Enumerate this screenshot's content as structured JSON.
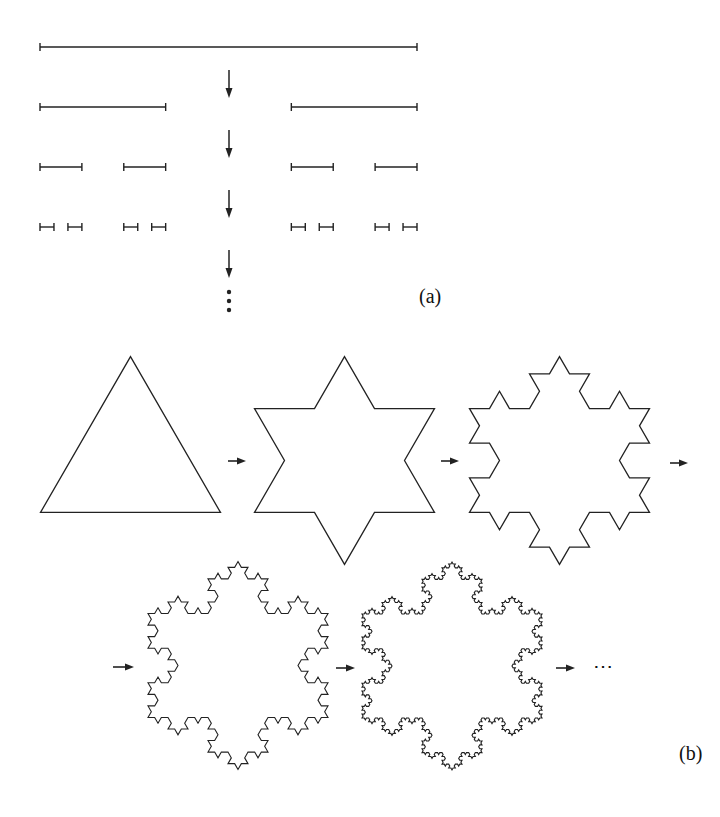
{
  "figure": {
    "stroke_color": "#222222",
    "background": "#ffffff"
  },
  "panel_a": {
    "label": "(a)",
    "title": "Cantor set construction",
    "x_start": 40,
    "x_end": 417,
    "row_y": [
      47,
      107,
      167,
      227
    ],
    "iterations": 4,
    "arrow_x": 229,
    "arrows_y": [
      [
        70,
        98
      ],
      [
        130,
        158
      ],
      [
        190,
        218
      ],
      [
        250,
        278
      ]
    ],
    "continuation_dots_y": [
      292,
      301,
      310
    ]
  },
  "panel_b": {
    "label": "(b)",
    "title": "Koch snowflake construction",
    "side": 180,
    "snowflakes": [
      {
        "iteration": 0,
        "cx": 130.5,
        "cy": 460.5
      },
      {
        "iteration": 1,
        "cx": 344.5,
        "cy": 460.5
      },
      {
        "iteration": 2,
        "cx": 559.5,
        "cy": 460.5
      },
      {
        "iteration": 3,
        "cx": 238.0,
        "cy": 665.5
      },
      {
        "iteration": 4,
        "cx": 452.0,
        "cy": 666.0
      }
    ],
    "arrows": [
      {
        "x1": 228,
        "x2": 246,
        "y": 461
      },
      {
        "x1": 441,
        "x2": 459,
        "y": 461
      },
      {
        "x1": 670,
        "x2": 688,
        "y": 463
      },
      {
        "x1": 113,
        "x2": 134,
        "y": 667
      },
      {
        "x1": 336,
        "x2": 355,
        "y": 668
      },
      {
        "x1": 556,
        "x2": 575,
        "y": 668
      }
    ],
    "continuation": "⋯"
  }
}
